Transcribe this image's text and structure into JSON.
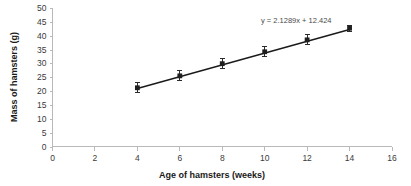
{
  "chart_data": {
    "type": "scatter",
    "title": "",
    "xlabel": "Age of hamsters (weeks)",
    "ylabel": "Mass of hamsters (g)",
    "xlim": [
      0,
      16
    ],
    "ylim": [
      0,
      50
    ],
    "xticks": [
      0,
      2,
      4,
      6,
      8,
      10,
      12,
      14,
      16
    ],
    "yticks": [
      0,
      5,
      10,
      15,
      20,
      25,
      30,
      35,
      40,
      45,
      50
    ],
    "xtick_labels": [
      "0",
      "2",
      "4",
      "6",
      "8",
      "10",
      "12",
      "14",
      "16"
    ],
    "ytick_labels": [
      "0",
      "5",
      "10",
      "15",
      "20",
      "25",
      "30",
      "35",
      "40",
      "45",
      "50"
    ],
    "grid": false,
    "legend": false,
    "x": [
      4,
      6,
      8,
      10,
      12,
      14
    ],
    "values": [
      21.2,
      25.5,
      29.9,
      34.2,
      38.5,
      42.7
    ],
    "yerr": [
      2.0,
      2.0,
      2.0,
      2.0,
      2.0,
      1.2
    ],
    "series": [
      {
        "name": "Mass of hamsters",
        "x": [
          4,
          6,
          8,
          10,
          12,
          14
        ],
        "values": [
          21.2,
          25.5,
          29.9,
          34.2,
          38.5,
          42.7
        ],
        "yerr": [
          2.0,
          2.0,
          2.0,
          2.0,
          2.0,
          1.2
        ],
        "marker": "square",
        "color": "#1f1f1f"
      }
    ],
    "trendline": {
      "slope": 2.1289,
      "intercept": 12.424,
      "x_start": 4,
      "x_end": 14,
      "color": "#1a1a1a"
    },
    "annotations": [
      {
        "text": "y = 2.1289x + 12.424",
        "x": 12.2,
        "y": 47.0
      }
    ]
  },
  "colors": {
    "axis": "#b9b9b9",
    "marker": "#1f1f1f",
    "line": "#1a1a1a",
    "tick_text": "#3b3b3b",
    "title_text": "#1a1a1a",
    "annotation_text": "#4a4a4a",
    "background": "#ffffff"
  }
}
